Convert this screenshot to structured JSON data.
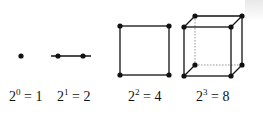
{
  "diagram": {
    "title": "",
    "stroke_color": "#111111",
    "dashed_color": "#888888",
    "figures": [
      {
        "name": "point",
        "dimension": 0,
        "vertices": 1,
        "label": {
          "base": "2",
          "exp": "0",
          "rest": " = 1"
        }
      },
      {
        "name": "segment",
        "dimension": 1,
        "vertices": 2,
        "label": {
          "base": "2",
          "exp": "1",
          "rest": " = 2"
        }
      },
      {
        "name": "square",
        "dimension": 2,
        "vertices": 4,
        "label": {
          "base": "2",
          "exp": "2",
          "rest": " = 4"
        }
      },
      {
        "name": "cube",
        "dimension": 3,
        "vertices": 8,
        "label": {
          "base": "2",
          "exp": "3",
          "rest": " = 8"
        }
      }
    ]
  }
}
